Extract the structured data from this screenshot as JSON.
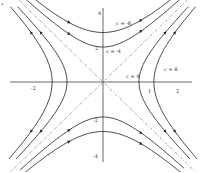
{
  "diagram": {
    "origin_px": [
      103,
      82
    ],
    "scale_px": {
      "x": 36,
      "y": 17.5
    },
    "axis_ticks": {
      "x": [
        {
          "value": -2,
          "label": "-2"
        },
        {
          "value": 1,
          "label": "1"
        },
        {
          "value": 2,
          "label": "2"
        }
      ],
      "y": [
        {
          "value": 4,
          "label": "4"
        },
        {
          "value": 2,
          "label": "2"
        },
        {
          "value": -2,
          "label": "-2"
        },
        {
          "value": -4,
          "label": "-4"
        }
      ]
    },
    "curve_labels": {
      "c_neg8": "c = -8",
      "c_neg4": "c = -4",
      "c_pos4": "c = 4",
      "c_pos8": "c = 8"
    },
    "curves": [
      {
        "c": -8,
        "family": "vertical"
      },
      {
        "c": -4,
        "family": "vertical"
      },
      {
        "c": 4,
        "family": "horizontal"
      },
      {
        "c": 8,
        "family": "horizontal"
      }
    ],
    "asymptotes": [
      "y = 2x",
      "y = -2x"
    ],
    "corner_mark": "•"
  },
  "colors": {
    "ink": "#333333",
    "background": "#ffffff"
  }
}
